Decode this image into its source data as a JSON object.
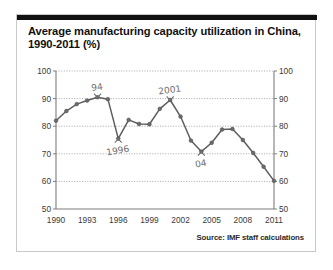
{
  "figure": {
    "title": "Average manufacturing capacity utilization in China,\n1990-2011 (%)",
    "source": "Source: IMF staff calculations"
  },
  "chart_data": {
    "type": "line",
    "title": "Average manufacturing capacity utilization in China, 1990-2011 (%)",
    "xlabel": "",
    "ylabel": "",
    "xlim": [
      1990,
      2011
    ],
    "ylim": [
      50,
      100
    ],
    "grid": true,
    "legend": "none",
    "y_ticks": [
      50,
      60,
      70,
      80,
      90,
      100
    ],
    "y_ticks_right": [
      50,
      60,
      70,
      80,
      90,
      100
    ],
    "x_ticks": [
      1990,
      1993,
      1996,
      1999,
      2002,
      2005,
      2008,
      2011
    ],
    "x": [
      1990,
      1991,
      1992,
      1993,
      1994,
      1995,
      1996,
      1997,
      1998,
      1999,
      2000,
      2001,
      2002,
      2003,
      2004,
      2005,
      2006,
      2007,
      2008,
      2009,
      2010,
      2011
    ],
    "values": [
      82.0,
      85.5,
      88.0,
      89.3,
      90.5,
      89.8,
      75.5,
      82.3,
      80.8,
      80.7,
      86.3,
      89.5,
      83.5,
      74.8,
      70.8,
      74.0,
      78.8,
      79.0,
      75.0,
      70.3,
      65.3,
      60.2
    ],
    "series": [
      {
        "name": "Capacity utilization",
        "values": [
          82.0,
          85.5,
          88.0,
          89.3,
          90.5,
          89.8,
          75.5,
          82.3,
          80.8,
          80.7,
          86.3,
          89.5,
          83.5,
          74.8,
          70.8,
          74.0,
          78.8,
          79.0,
          75.0,
          70.3,
          65.3,
          60.2
        ]
      }
    ],
    "annotations": [
      {
        "text": "94",
        "x": 1994,
        "y": 90.5,
        "placement": "above"
      },
      {
        "text": "1996",
        "x": 1996,
        "y": 75.5,
        "placement": "below"
      },
      {
        "text": "2001",
        "x": 2001,
        "y": 89.5,
        "placement": "above"
      },
      {
        "text": "04",
        "x": 2004,
        "y": 70.8,
        "placement": "below"
      }
    ]
  }
}
